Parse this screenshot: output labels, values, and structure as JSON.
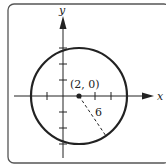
{
  "diagram": {
    "type": "circle-on-coordinate-plane",
    "axes": {
      "x_label": "x",
      "y_label": "y",
      "tick_spacing_units": 2,
      "x_ticks": [
        -2,
        2,
        4,
        6
      ],
      "y_ticks": [
        -6,
        -4,
        -2,
        2,
        4,
        6
      ]
    },
    "circle": {
      "center_label": "(2, 0)",
      "center": [
        2,
        0
      ],
      "radius": 6,
      "radius_label": "6"
    },
    "colors": {
      "stroke": "#222222",
      "border": "#555555",
      "background": "#ffffff"
    }
  }
}
